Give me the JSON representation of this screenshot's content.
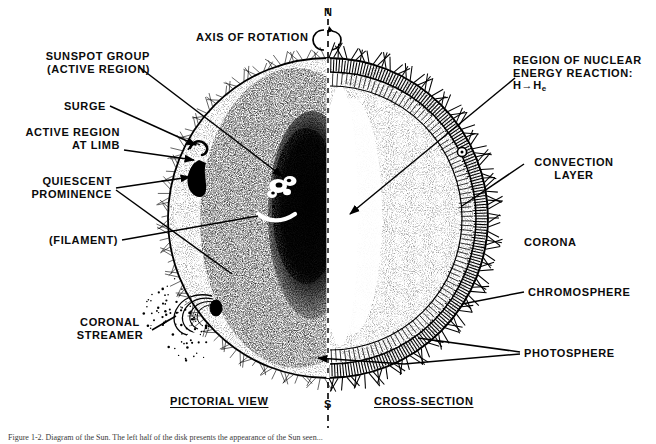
{
  "figure": {
    "domain": "Diagram",
    "background_color": "#ffffff",
    "ink_color": "#000000"
  },
  "axis": {
    "label": "AXIS OF ROTATION",
    "north_pole": "N",
    "south_pole": "S",
    "rotation_icon": "rotation-arrow-icon"
  },
  "view_titles": {
    "left": "PICTORIAL VIEW",
    "right": "CROSS-SECTION"
  },
  "labels_left": [
    {
      "id": "sunspot-group",
      "lines": [
        "SUNSPOT GROUP",
        "(ACTIVE REGION)"
      ]
    },
    {
      "id": "surge",
      "lines": [
        "SURGE"
      ]
    },
    {
      "id": "active-region-at-limb",
      "lines": [
        "ACTIVE REGION",
        "AT LIMB"
      ]
    },
    {
      "id": "quiescent-prominence",
      "lines": [
        "QUIESCENT",
        "PROMINENCE"
      ]
    },
    {
      "id": "filament",
      "lines": [
        "(FILAMENT)"
      ]
    },
    {
      "id": "coronal-streamer",
      "lines": [
        "CORONAL",
        "STREAMER"
      ]
    }
  ],
  "labels_right": [
    {
      "id": "nuclear-region",
      "lines": [
        "REGION OF NUCLEAR",
        "ENERGY REACTION:"
      ],
      "formula_head": "H",
      "formula_arrow": "→",
      "formula_tail": "H",
      "formula_sub": "e"
    },
    {
      "id": "convection-layer",
      "lines": [
        "CONVECTION",
        "LAYER"
      ]
    },
    {
      "id": "corona",
      "lines": [
        "CORONA"
      ]
    },
    {
      "id": "chromosphere",
      "lines": [
        "CHROMOSPHERE"
      ]
    },
    {
      "id": "photosphere",
      "lines": [
        "PHOTOSPHERE"
      ]
    }
  ],
  "caption": {
    "text": "Figure 1-2.  Diagram of the Sun. The left half of the disk presents the appearance of the Sun seen..."
  }
}
